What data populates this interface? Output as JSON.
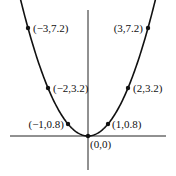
{
  "chart_data": {
    "type": "line",
    "title": "",
    "xlabel": "",
    "ylabel": "",
    "function": "y = 0.8x^2",
    "grid": false,
    "legend": null,
    "points": [
      {
        "x": -3,
        "y": 7.2,
        "label": "(−3,7.2)"
      },
      {
        "x": -2,
        "y": 3.2,
        "label": "(−2,3.2)"
      },
      {
        "x": -1,
        "y": 0.8,
        "label": "(−1,0.8)"
      },
      {
        "x": 0,
        "y": 0,
        "label": "(0,0)"
      },
      {
        "x": 1,
        "y": 0.8,
        "label": "(1,0.8)"
      },
      {
        "x": 2,
        "y": 3.2,
        "label": "(2,3.2)"
      },
      {
        "x": 3,
        "y": 7.2,
        "label": "(3,7.2)"
      }
    ],
    "xlim": [
      -4.3,
      4.2
    ],
    "ylim": [
      -2.6,
      8.8
    ]
  },
  "colors": {
    "curve": "#111111",
    "axes": "#222222"
  }
}
